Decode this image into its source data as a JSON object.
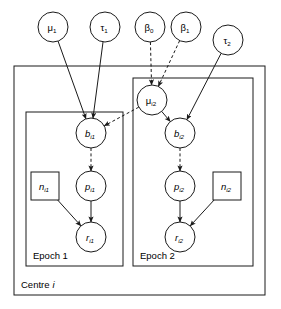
{
  "diagram": {
    "type": "bayesian-network-plate-diagram",
    "background_color": "#ffffff",
    "stroke_color": "#1a1a1a",
    "plates": [
      {
        "id": "centre",
        "label": "Centre",
        "label_italic_suffix": "i",
        "x": 14,
        "y": 66,
        "w": 251,
        "h": 229
      },
      {
        "id": "epoch1",
        "label": "Epoch 1",
        "label_italic_suffix": "",
        "x": 26,
        "y": 112,
        "w": 97,
        "h": 154
      },
      {
        "id": "epoch2",
        "label": "Epoch 2",
        "label_italic_suffix": "",
        "x": 133,
        "y": 78,
        "w": 120,
        "h": 188
      }
    ],
    "nodes": [
      {
        "id": "mu1",
        "shape": "circle",
        "base": "μ",
        "sub": "1",
        "italic": false,
        "cx": 53,
        "cy": 27,
        "r": 15
      },
      {
        "id": "tau1",
        "shape": "circle",
        "base": "τ",
        "sub": "1",
        "italic": false,
        "cx": 105,
        "cy": 27,
        "r": 15
      },
      {
        "id": "beta0",
        "shape": "circle",
        "base": "β",
        "sub": "0",
        "italic": false,
        "cx": 150,
        "cy": 27,
        "r": 15
      },
      {
        "id": "beta1",
        "shape": "circle",
        "base": "β",
        "sub": "1",
        "italic": false,
        "cx": 186,
        "cy": 27,
        "r": 15
      },
      {
        "id": "tau2",
        "shape": "circle",
        "base": "τ",
        "sub": "2",
        "italic": false,
        "cx": 228,
        "cy": 40,
        "r": 15
      },
      {
        "id": "mui2",
        "shape": "circle",
        "base": "μ",
        "sub": "i2",
        "italic": false,
        "cx": 152,
        "cy": 100,
        "r": 15
      },
      {
        "id": "bi1",
        "shape": "circle",
        "base": "b",
        "sub": "i1",
        "italic": true,
        "cx": 91,
        "cy": 133,
        "r": 15
      },
      {
        "id": "bi2",
        "shape": "circle",
        "base": "b",
        "sub": "i2",
        "italic": true,
        "cx": 180,
        "cy": 133,
        "r": 15
      },
      {
        "id": "pi1",
        "shape": "circle",
        "base": "p",
        "sub": "i1",
        "italic": true,
        "cx": 91,
        "cy": 186,
        "r": 15
      },
      {
        "id": "pi2",
        "shape": "circle",
        "base": "p",
        "sub": "i2",
        "italic": true,
        "cx": 180,
        "cy": 186,
        "r": 15
      },
      {
        "id": "ri1",
        "shape": "circle",
        "base": "r",
        "sub": "i1",
        "italic": true,
        "cx": 91,
        "cy": 237,
        "r": 15
      },
      {
        "id": "ri2",
        "shape": "circle",
        "base": "r",
        "sub": "i2",
        "italic": true,
        "cx": 180,
        "cy": 237,
        "r": 15
      },
      {
        "id": "ni1",
        "shape": "square",
        "base": "n",
        "sub": "i1",
        "italic": true,
        "cx": 45,
        "cy": 186,
        "r": 14
      },
      {
        "id": "ni2",
        "shape": "square",
        "base": "n",
        "sub": "i2",
        "italic": true,
        "cx": 227,
        "cy": 186,
        "r": 14
      }
    ],
    "edges": [
      {
        "from": "mu1",
        "to": "bi1",
        "style": "solid"
      },
      {
        "from": "tau1",
        "to": "bi1",
        "style": "solid"
      },
      {
        "from": "beta0",
        "to": "mui2",
        "style": "dashed"
      },
      {
        "from": "beta1",
        "to": "mui2",
        "style": "dashed"
      },
      {
        "from": "tau2",
        "to": "bi2",
        "style": "solid"
      },
      {
        "from": "mui2",
        "to": "bi2",
        "style": "solid"
      },
      {
        "from": "mui2",
        "to": "bi1",
        "style": "dashed"
      },
      {
        "from": "bi1",
        "to": "pi1",
        "style": "dashed"
      },
      {
        "from": "bi2",
        "to": "pi2",
        "style": "dashed"
      },
      {
        "from": "pi1",
        "to": "ri1",
        "style": "solid"
      },
      {
        "from": "pi2",
        "to": "ri2",
        "style": "solid"
      },
      {
        "from": "ni1",
        "to": "ri1",
        "style": "solid"
      },
      {
        "from": "ni2",
        "to": "ri2",
        "style": "solid"
      }
    ]
  }
}
